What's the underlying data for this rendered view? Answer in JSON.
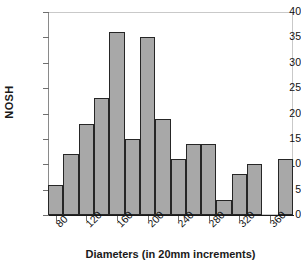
{
  "chart_data": {
    "type": "bar",
    "title": "",
    "subtitle": "",
    "xlabel": "Diameters (in 20mm increments)",
    "ylabel": "NOSH",
    "ylim": [
      0,
      40
    ],
    "y_ticks": [
      0,
      5,
      10,
      15,
      20,
      25,
      30,
      35,
      40
    ],
    "x_tick_labels": [
      "80",
      "120",
      "160",
      "200",
      "240",
      "280",
      "320",
      "360"
    ],
    "grid": false,
    "legend": null,
    "bin_width_mm": 20,
    "categories": [
      "80",
      "100",
      "120",
      "140",
      "160",
      "180",
      "200",
      "220",
      "240",
      "260",
      "280",
      "300",
      "320",
      "340",
      "360",
      "380"
    ],
    "values": [
      6,
      12,
      18,
      23,
      36,
      15,
      35,
      19,
      11,
      14,
      14,
      3,
      8,
      10,
      0,
      11
    ],
    "bar_color": "#a8a8a8",
    "bar_edge_color": "#262626",
    "frame_color": "#c9c9c9",
    "axis_color": "#1a1a1a",
    "background": "#ffffff"
  }
}
